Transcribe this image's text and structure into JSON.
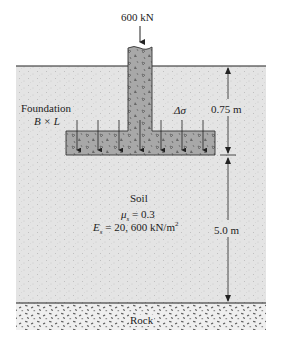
{
  "load": {
    "label": "600 kN"
  },
  "foundation": {
    "label": "Foundation",
    "size": "B × L"
  },
  "stress": {
    "label": "Δσ"
  },
  "dimensions": {
    "depth": "0.75 m",
    "soil_thickness": "5.0 m"
  },
  "soil": {
    "label": "Soil",
    "poisson": {
      "symbol": "μ",
      "sub": "s",
      "value": " = 0.3"
    },
    "modulus": {
      "symbol": "E",
      "sub": "s",
      "value": " = 20, 600 kN/m",
      "sup": "2"
    }
  },
  "rock": {
    "label": "Rock"
  },
  "colors": {
    "soil": "#e6e6e6",
    "concrete": "#a9a9a9",
    "rock": "#eeeeee",
    "line": "#222222"
  }
}
